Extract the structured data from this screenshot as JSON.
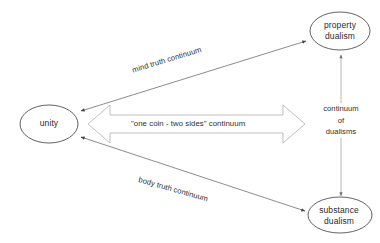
{
  "diagram": {
    "background_color": "#ffffff",
    "nodes": [
      {
        "id": "unity",
        "name": "unity",
        "label": "unity",
        "shape": "ellipse",
        "stroke_color": "#3a3a3a",
        "fill_color": "#ffffff"
      },
      {
        "id": "property-dualism",
        "name": "property dualism",
        "label_line_1": "property",
        "label_line_2": "dualism",
        "shape": "ellipse",
        "stroke_color": "#3a3a3a",
        "fill_color": "#ffffff"
      },
      {
        "id": "substance-dualism",
        "name": "substance dualism",
        "label_line_1": "substance",
        "label_line_2": "dualism",
        "shape": "ellipse",
        "stroke_color": "#3a3a3a",
        "fill_color": "#ffffff"
      }
    ],
    "edges": [
      {
        "id": "mind-truth",
        "from": "unity",
        "to": "property-dualism",
        "label": "mind truth continuum",
        "style": "thin-line",
        "arrowheads": "both",
        "stroke_color": "#555555"
      },
      {
        "id": "body-truth",
        "from": "unity",
        "to": "substance-dualism",
        "label": "body truth continuum",
        "style": "thin-line",
        "arrowheads": "both",
        "stroke_color": "#555555"
      },
      {
        "id": "one-coin",
        "from": "unity",
        "to": "dualisms",
        "label": "\"one coin - two sides\" continuum",
        "style": "block-arrow",
        "arrowheads": "both",
        "stroke_color": "#b3b3b3",
        "fill_color": "#ffffff"
      },
      {
        "id": "dualisms-axis",
        "from": "property-dualism",
        "to": "substance-dualism",
        "label_line_1": "continuum",
        "label_line_2": "of",
        "label_line_3": "dualisms",
        "style": "thin-line",
        "arrowheads": "both",
        "stroke_color": "#808080"
      }
    ]
  }
}
